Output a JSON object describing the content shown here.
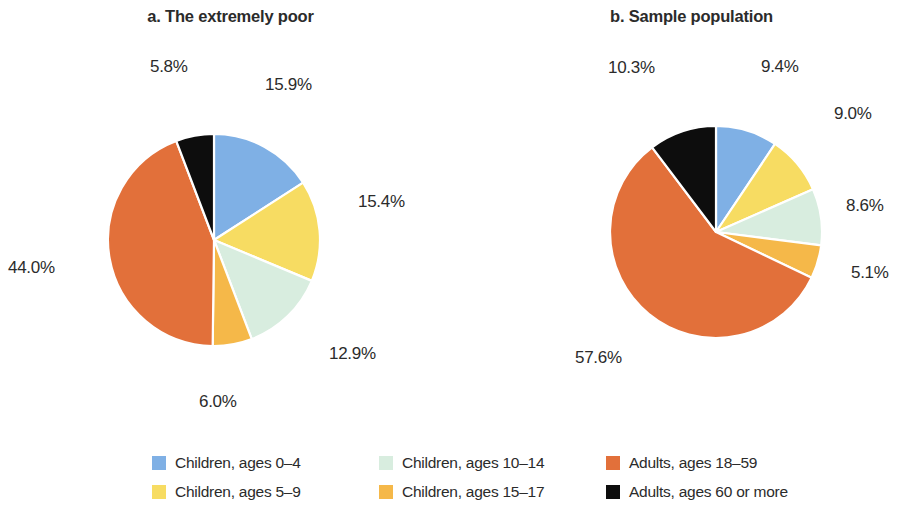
{
  "figure": {
    "background": "#ffffff",
    "text_color": "#2b2b2b"
  },
  "panels": [
    {
      "id": "a",
      "title": "a. The extremely poor"
    },
    {
      "id": "b",
      "title": "b. Sample population"
    }
  ],
  "legend": {
    "items": [
      {
        "label": "Children, ages 0–4",
        "color": "#7fb0e5",
        "key": "children-0-4"
      },
      {
        "label": "Children, ages 10–14",
        "color": "#d8eddf",
        "key": "children-10-14"
      },
      {
        "label": "Adults, ages 18–59",
        "color": "#e2703a",
        "key": "adults-18-59"
      },
      {
        "label": "Children, ages 5–9",
        "color": "#f7dc62",
        "key": "children-5-9"
      },
      {
        "label": "Children, ages 15–17",
        "color": "#f5b849",
        "key": "children-15-17"
      },
      {
        "label": "Adults, ages 60 or more",
        "color": "#0d0d0d",
        "key": "adults-60-plus"
      }
    ]
  },
  "chart_data": [
    {
      "type": "pie",
      "title": "a. The extremely poor",
      "categories": [
        "Children, ages 0–4",
        "Children, ages 5–9",
        "Children, ages 10–14",
        "Children, ages 15–17",
        "Adults, ages 18–59",
        "Adults, ages 60 or more"
      ],
      "values": [
        15.9,
        15.4,
        12.9,
        6.0,
        44.0,
        5.8
      ],
      "labels": [
        "15.9%",
        "15.4%",
        "12.9%",
        "6.0%",
        "44.0%",
        "5.8%"
      ],
      "colors": [
        "#7fb0e5",
        "#f7dc62",
        "#d8eddf",
        "#f5b849",
        "#e2703a",
        "#0d0d0d"
      ],
      "units": "percent",
      "start_angle_deg": 0,
      "direction": "clockwise",
      "legend_position": "bottom"
    },
    {
      "type": "pie",
      "title": "b. Sample population",
      "categories": [
        "Children, ages 0–4",
        "Children, ages 5–9",
        "Children, ages 10–14",
        "Children, ages 15–17",
        "Adults, ages 18–59",
        "Adults, ages 60 or more"
      ],
      "values": [
        9.4,
        9.0,
        8.6,
        5.1,
        57.6,
        10.3
      ],
      "labels": [
        "9.4%",
        "9.0%",
        "8.6%",
        "5.1%",
        "57.6%",
        "10.3%"
      ],
      "colors": [
        "#7fb0e5",
        "#f7dc62",
        "#d8eddf",
        "#f5b849",
        "#e2703a",
        "#0d0d0d"
      ],
      "units": "percent",
      "start_angle_deg": 0,
      "direction": "clockwise",
      "legend_position": "bottom"
    }
  ],
  "label_positions": {
    "a": [
      {
        "text": "15.9%",
        "left": 265,
        "top": 75
      },
      {
        "text": "15.4%",
        "left": 358,
        "top": 192
      },
      {
        "text": "12.9%",
        "left": 329,
        "top": 344
      },
      {
        "text": "6.0%",
        "left": 199,
        "top": 392
      },
      {
        "text": "44.0%",
        "left": 8,
        "top": 258
      },
      {
        "text": "5.8%",
        "left": 150,
        "top": 57
      }
    ],
    "b": [
      {
        "text": "9.4%",
        "left": 761,
        "top": 57
      },
      {
        "text": "9.0%",
        "left": 834,
        "top": 104
      },
      {
        "text": "8.6%",
        "left": 846,
        "top": 196
      },
      {
        "text": "5.1%",
        "left": 851,
        "top": 263
      },
      {
        "text": "57.6%",
        "left": 575,
        "top": 348
      },
      {
        "text": "10.3%",
        "left": 608,
        "top": 58
      }
    ]
  }
}
